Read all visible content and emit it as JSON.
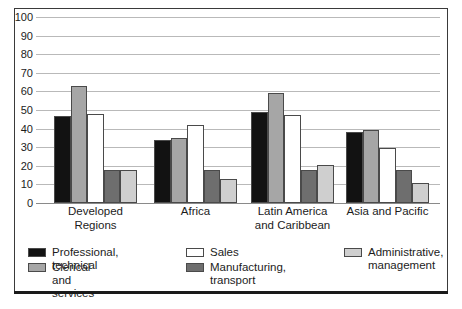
{
  "chart_data": {
    "type": "bar",
    "title": "",
    "subtitle": "",
    "xlabel": "",
    "ylabel": "",
    "ylim": [
      0,
      100
    ],
    "yticks": [
      0,
      10,
      20,
      30,
      40,
      50,
      60,
      70,
      80,
      90,
      100
    ],
    "grid": true,
    "legend_position": "bottom",
    "categories": [
      "Developed\nRegions",
      "Africa",
      "Latin America\nand Caribbean",
      "Asia and Pacific"
    ],
    "series": [
      {
        "name": "Professional, technical",
        "color": "#121212",
        "values": [
          47,
          34,
          49,
          38
        ]
      },
      {
        "name": "Clerical and services",
        "color": "#a6a6a6",
        "values": [
          63,
          35,
          59,
          39
        ]
      },
      {
        "name": "Sales",
        "color": "#ffffff",
        "values": [
          48,
          42,
          47.5,
          29.5
        ]
      },
      {
        "name": "Manufacturing,\ntransport",
        "color": "#6e6e6e",
        "values": [
          18,
          18,
          17.5,
          18
        ]
      },
      {
        "name": "Administrative,\nmanagement",
        "color": "#cfcfcf",
        "values": [
          18,
          13,
          20.5,
          10.5
        ]
      }
    ]
  },
  "legend": {
    "columns": [
      [
        {
          "label": "Professional, technical",
          "color": "#121212"
        },
        {
          "label": "Clerical and services",
          "color": "#a6a6a6"
        }
      ],
      [
        {
          "label": "Sales",
          "color": "#ffffff"
        },
        {
          "label": "Manufacturing,\ntransport",
          "color": "#6e6e6e"
        }
      ],
      [
        {
          "label": "Administrative,\nmanagement",
          "color": "#cfcfcf"
        }
      ]
    ]
  }
}
